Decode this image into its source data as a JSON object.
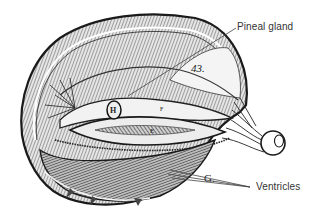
{
  "figure": {
    "plate_number": "43.",
    "plate_letters": {
      "H": "H",
      "E": "E",
      "F": "F",
      "G": "G."
    }
  },
  "annotations": [
    {
      "id": "pineal",
      "label": "Pineal gland",
      "x": 237,
      "y": 21
    },
    {
      "id": "ventricles",
      "label": "Ventricles",
      "x": 256,
      "y": 182
    }
  ],
  "colors": {
    "background": "#ffffff",
    "ink": "#1a1a1a",
    "label_text": "#333333",
    "leader_line": "#444444"
  }
}
